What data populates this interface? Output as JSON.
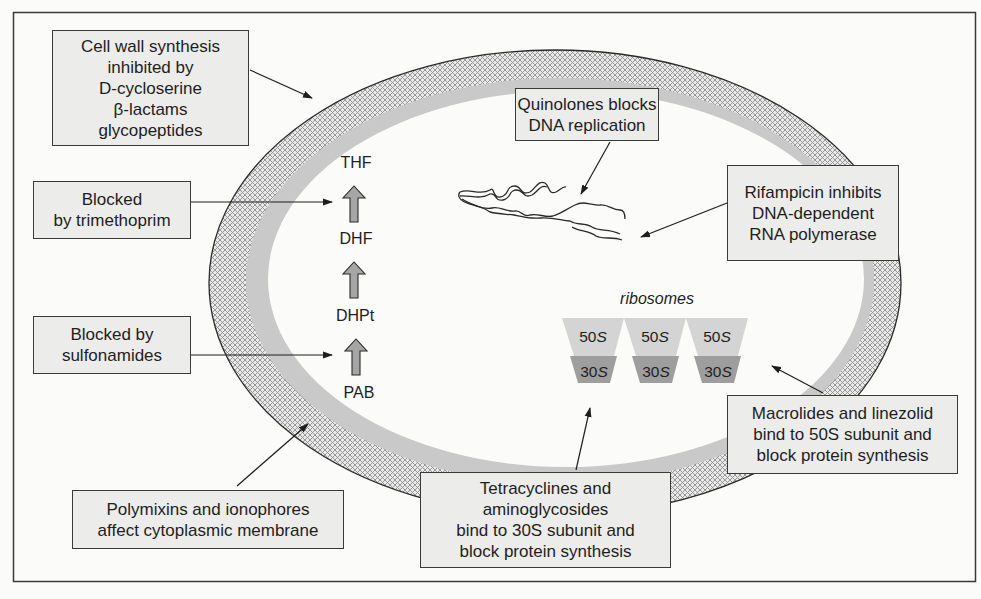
{
  "diagram": {
    "boxes": {
      "cell_wall": {
        "lines": [
          "Cell wall synthesis",
          "inhibited by",
          "D-cycloserine",
          "β-lactams",
          "glycopeptides"
        ]
      },
      "trimethoprim": {
        "lines": [
          "Blocked",
          "by trimethoprim"
        ]
      },
      "sulfonamides": {
        "lines": [
          "Blocked by",
          "sulfonamides"
        ]
      },
      "polymixins": {
        "lines": [
          "Polymixins and ionophores",
          "affect cytoplasmic membrane"
        ]
      },
      "tetracyclines": {
        "lines": [
          "Tetracyclines and",
          "aminoglycosides",
          "bind to 30S subunit and",
          "block protein  synthesis"
        ]
      },
      "macrolides": {
        "lines": [
          "Macrolides and linezolid",
          "bind to 50S subunit and",
          "block protein synthesis"
        ]
      },
      "rifampicin": {
        "lines": [
          "Rifampicin inhibits",
          "DNA-dependent",
          "RNA polymerase"
        ]
      },
      "quinolones": {
        "lines": [
          "Quinolones blocks",
          "DNA replication"
        ]
      }
    },
    "folate_pathway": {
      "metabolites": [
        "THF",
        "DHF",
        "DHPt",
        "PAB"
      ]
    },
    "ribosomes": {
      "label": "ribosomes",
      "units": [
        {
          "large": "50",
          "small": "30",
          "suffix": "S"
        },
        {
          "large": "50",
          "small": "30",
          "suffix": "S"
        },
        {
          "large": "50",
          "small": "30",
          "suffix": "S"
        }
      ]
    },
    "colors": {
      "box_fill": "#ececeb",
      "border": "#3a3a3a",
      "wall_band": "#c9c9c9",
      "hatch": "#8e8e8e",
      "ribosome_50s": "#d4d4d4",
      "ribosome_30s": "#9e9e9e",
      "pathway_arrow": "#a6a6a6"
    }
  }
}
